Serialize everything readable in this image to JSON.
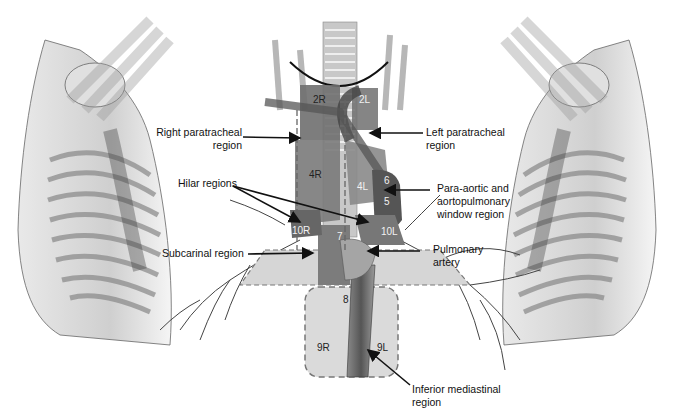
{
  "figure": {
    "colors": {
      "node_region": "#6f6f6f",
      "node_region_dark": "#4a4a4a",
      "region_fill": "#d8d8d8",
      "dashed_border": "#777777",
      "trachea": "#bdbdbd",
      "background": "#ffffff"
    }
  },
  "region_labels": [
    {
      "id": "right-paratracheal",
      "line1": "Right paratracheal",
      "line2": "region"
    },
    {
      "id": "left-paratracheal",
      "line1": "Left paratracheal",
      "line2": "region"
    },
    {
      "id": "hilar",
      "line1": "Hilar regions",
      "line2": ""
    },
    {
      "id": "para-aortic",
      "line1": "Para-aortic and",
      "line2": "aortopulmonary",
      "line3": "window region"
    },
    {
      "id": "subcarinal",
      "line1": "Subcarinal region",
      "line2": ""
    },
    {
      "id": "pulmonary-artery",
      "line1": "Pulmonary",
      "line2": "artery"
    },
    {
      "id": "inferior-mediastinal",
      "line1": "Inferior mediastinal",
      "line2": "region"
    }
  ],
  "stations": [
    "2R",
    "2L",
    "4R",
    "4L",
    "5",
    "6",
    "7",
    "8",
    "9R",
    "9L",
    "10R",
    "10L"
  ]
}
